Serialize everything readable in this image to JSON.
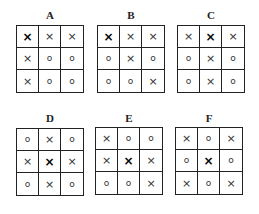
{
  "figure": {
    "panels": [
      {
        "label": "A",
        "left": 16,
        "label_top": 10,
        "grid_top": 25,
        "cells": [
          "x",
          "x",
          "x",
          "x",
          "o",
          "o",
          "x",
          "o",
          "o"
        ],
        "bold_index": 0
      },
      {
        "label": "B",
        "left": 97,
        "label_top": 10,
        "grid_top": 25,
        "cells": [
          "x",
          "x",
          "x",
          "o",
          "x",
          "o",
          "o",
          "o",
          "x"
        ],
        "bold_index": 0
      },
      {
        "label": "C",
        "left": 177,
        "label_top": 10,
        "grid_top": 25,
        "cells": [
          "x",
          "x",
          "x",
          "o",
          "x",
          "o",
          "o",
          "x",
          "o"
        ],
        "bold_index": 1
      },
      {
        "label": "D",
        "left": 16,
        "label_top": 113,
        "grid_top": 128,
        "cells": [
          "o",
          "x",
          "o",
          "x",
          "x",
          "x",
          "o",
          "x",
          "o"
        ],
        "bold_index": 4
      },
      {
        "label": "E",
        "left": 95,
        "label_top": 113,
        "grid_top": 127,
        "cells": [
          "x",
          "o",
          "o",
          "x",
          "x",
          "x",
          "o",
          "o",
          "x"
        ],
        "bold_index": 4
      },
      {
        "label": "F",
        "left": 175,
        "label_top": 113,
        "grid_top": 127,
        "cells": [
          "x",
          "o",
          "x",
          "o",
          "x",
          "o",
          "x",
          "o",
          "x"
        ],
        "bold_index": 4
      }
    ],
    "symbols": {
      "x": "×",
      "o": "o"
    }
  }
}
